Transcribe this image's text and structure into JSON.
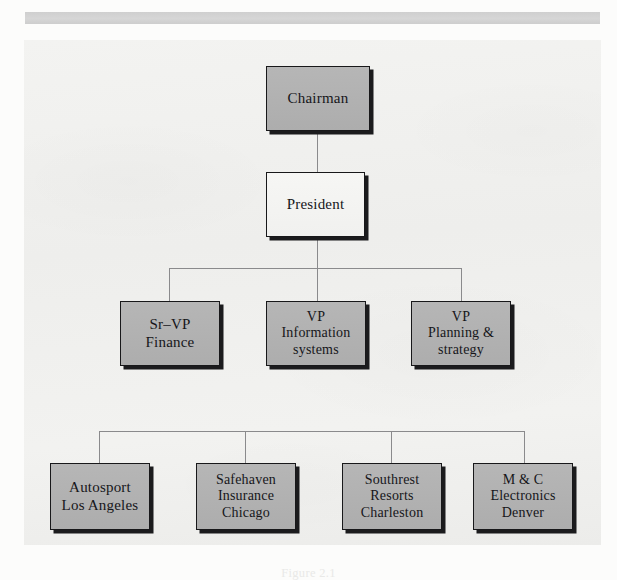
{
  "document": {
    "background_color": "#fcfcfb",
    "panel_color": "#f1f1ef",
    "header_bar_color": "#d2d2d2",
    "caption": "Figure 2.1"
  },
  "chart_data": {
    "type": "diagram",
    "diagram_kind": "organizational-chart",
    "title": "",
    "node_fill_gray": "#b3b3b3",
    "node_fill_white": "#f4f4f2",
    "border_color": "#18181a",
    "connector_color": "#8a8a8c",
    "levels": [
      {
        "level": 1,
        "nodes": [
          {
            "id": "chairman",
            "label": "Chairman",
            "fill": "gray",
            "x": 266,
            "y": 66,
            "w": 104,
            "h": 65
          }
        ]
      },
      {
        "level": 2,
        "nodes": [
          {
            "id": "president",
            "label": "President",
            "fill": "white",
            "x": 266,
            "y": 172,
            "w": 99,
            "h": 65
          }
        ]
      },
      {
        "level": 3,
        "nodes": [
          {
            "id": "sr-vp-finance",
            "label": "Sr–VP\nFinance",
            "fill": "gray",
            "x": 120,
            "y": 301,
            "w": 100,
            "h": 65
          },
          {
            "id": "vp-info-systems",
            "label": "VP\nInformation\nsystems",
            "fill": "gray",
            "x": 266,
            "y": 301,
            "w": 100,
            "h": 65
          },
          {
            "id": "vp-planning",
            "label": "VP\nPlanning &\nstrategy",
            "fill": "gray",
            "x": 411,
            "y": 301,
            "w": 100,
            "h": 65
          }
        ]
      },
      {
        "level": 4,
        "nodes": [
          {
            "id": "autosport",
            "label": "Autosport\nLos Angeles",
            "fill": "gray",
            "x": 50,
            "y": 463,
            "w": 100,
            "h": 67
          },
          {
            "id": "safehaven",
            "label": "Safehaven\nInsurance\nChicago",
            "fill": "gray",
            "x": 196,
            "y": 463,
            "w": 100,
            "h": 67
          },
          {
            "id": "southrest",
            "label": "Southrest\nResorts\nCharleston",
            "fill": "gray",
            "x": 342,
            "y": 463,
            "w": 100,
            "h": 67
          },
          {
            "id": "mandc",
            "label": "M & C\nElectronics\nDenver",
            "fill": "gray",
            "x": 473,
            "y": 463,
            "w": 100,
            "h": 67
          }
        ]
      }
    ],
    "edges": [
      {
        "from": "chairman",
        "to": "president",
        "kind": "straight"
      },
      {
        "from": "president",
        "to": "sr-vp-finance",
        "kind": "bus"
      },
      {
        "from": "president",
        "to": "vp-info-systems",
        "kind": "bus"
      },
      {
        "from": "president",
        "to": "vp-planning",
        "kind": "bus"
      },
      {
        "from": "bus-lower",
        "to": "autosport",
        "kind": "bus"
      },
      {
        "from": "bus-lower",
        "to": "safehaven",
        "kind": "bus"
      },
      {
        "from": "bus-lower",
        "to": "southrest",
        "kind": "bus"
      },
      {
        "from": "bus-lower",
        "to": "mandc",
        "kind": "bus"
      }
    ],
    "connector_segments": [
      {
        "id": "c1",
        "orient": "v",
        "x": 317,
        "y": 131,
        "len": 41
      },
      {
        "id": "c2",
        "orient": "v",
        "x": 317,
        "y": 237,
        "len": 32
      },
      {
        "id": "c3",
        "orient": "h",
        "x": 169,
        "y": 268,
        "len": 293
      },
      {
        "id": "c4",
        "orient": "v",
        "x": 169,
        "y": 268,
        "len": 34
      },
      {
        "id": "c5",
        "orient": "v",
        "x": 317,
        "y": 268,
        "len": 34
      },
      {
        "id": "c6",
        "orient": "v",
        "x": 461,
        "y": 268,
        "len": 34
      },
      {
        "id": "c7",
        "orient": "h",
        "x": 99,
        "y": 431,
        "len": 426
      },
      {
        "id": "c8",
        "orient": "v",
        "x": 99,
        "y": 431,
        "len": 33
      },
      {
        "id": "c9",
        "orient": "v",
        "x": 245,
        "y": 431,
        "len": 33
      },
      {
        "id": "c10",
        "orient": "v",
        "x": 391,
        "y": 431,
        "len": 33
      },
      {
        "id": "c11",
        "orient": "v",
        "x": 524,
        "y": 431,
        "len": 33
      }
    ]
  }
}
